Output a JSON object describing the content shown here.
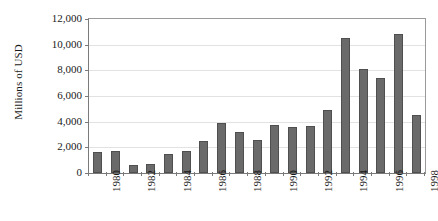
{
  "chart_data": {
    "type": "bar",
    "title": "",
    "xlabel": "",
    "ylabel": "Millions of USD",
    "ylim": [
      0,
      12000
    ],
    "grid": true,
    "legend": "none",
    "orientation": "vertical",
    "bar_color": "#6a6a6a",
    "bar_edge_color": "#4f4f4f",
    "gridline_color": "#e2e2e2",
    "axis_color": "#7a7a7a",
    "categories": [
      "1980",
      "1981",
      "1982",
      "1983",
      "1984",
      "1985",
      "1986",
      "1987",
      "1988",
      "1989",
      "1990",
      "1991",
      "1992",
      "1993",
      "1994",
      "1995",
      "1996",
      "1997",
      "1998"
    ],
    "values": [
      1650,
      1750,
      650,
      730,
      1480,
      1750,
      2470,
      3900,
      3180,
      2560,
      3780,
      3620,
      3650,
      4900,
      10520,
      8120,
      7420,
      10830,
      4520
    ],
    "y_ticks": [
      0,
      2000,
      4000,
      6000,
      8000,
      10000,
      12000
    ],
    "y_tick_labels": [
      "0",
      "2,000",
      "4,000",
      "6,000",
      "8,000",
      "10,000",
      "12,000"
    ],
    "x_tick_labels_visible": [
      "1980",
      "",
      "1982",
      "",
      "1984",
      "",
      "1986",
      "",
      "1988",
      "",
      "1990",
      "",
      "1992",
      "",
      "1994",
      "",
      "1996",
      "",
      "1998"
    ]
  },
  "axis": {
    "y_title": "Millions of USD"
  }
}
